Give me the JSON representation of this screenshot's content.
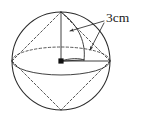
{
  "figure": {
    "kind": "geometry-diagram",
    "background_color": "#ffffff",
    "ink_color": "#2b2b2b"
  },
  "labels": {
    "radius_label": "3cm"
  },
  "geometry": {
    "sphere": {
      "center_x": 61,
      "center_y": 61,
      "radius_x": 49,
      "radius_y": 49,
      "left_x": 12,
      "right_x": 110,
      "top_y": 12,
      "bottom_y": 110
    },
    "equator_ellipse": {
      "center_x": 61,
      "center_y": 61,
      "radius_x": 49,
      "radius_y": 14
    },
    "top_apex": {
      "x": 61,
      "y": 12
    },
    "bottom_apex": {
      "x": 61,
      "y": 110
    },
    "center_point": {
      "x": 61,
      "y": 61
    },
    "vertical_radius": {
      "from_x": 61,
      "from_y": 61,
      "to_x": 61,
      "to_y": 12
    },
    "horizontal_radius": {
      "from_x": 61,
      "from_y": 61,
      "to_x": 110,
      "to_y": 61
    }
  },
  "leaders": {
    "upper_arrow_target": {
      "x": 68,
      "y": 31
    },
    "lower_arrow_target": {
      "x": 88,
      "y": 51
    },
    "label_anchor": {
      "x": 108,
      "y": 20
    }
  }
}
